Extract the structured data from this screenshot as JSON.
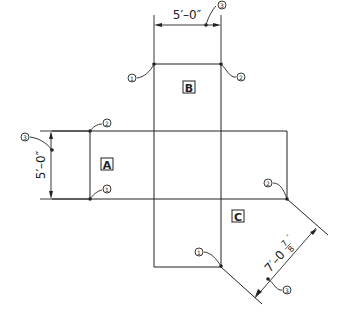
{
  "diagram": {
    "type": "surface development / layout drawing",
    "panels": [
      {
        "id": "A",
        "label": "A"
      },
      {
        "id": "B",
        "label": "B"
      },
      {
        "id": "C",
        "label": "C"
      }
    ],
    "dimensions": [
      {
        "id": "top",
        "text": "5′–0″"
      },
      {
        "id": "left",
        "text": "5′–0″"
      },
      {
        "id": "diag_main",
        "text": "7′–0"
      },
      {
        "id": "diag_frac_num",
        "text": "7"
      },
      {
        "id": "diag_frac_den",
        "text": "8"
      },
      {
        "id": "diag_inch",
        "text": "″"
      }
    ],
    "callouts": {
      "one": "1",
      "two": "2",
      "three": "3"
    },
    "colors": {
      "line": "#222222",
      "background": "#ffffff"
    }
  }
}
